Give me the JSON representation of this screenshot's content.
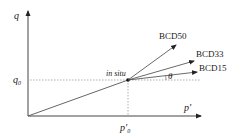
{
  "diagram": {
    "axes": {
      "y_label": "q",
      "x_label": "p'",
      "q0_label": "q",
      "q0_sub": "0",
      "p0_label": "p'",
      "p0_sub": "0"
    },
    "point_label": "in situ",
    "angle_label": "θ",
    "paths": [
      {
        "label": "BCD50"
      },
      {
        "label": "BCD33"
      },
      {
        "label": "BCD15"
      }
    ],
    "colors": {
      "line": "#333333",
      "dotted": "#888888",
      "text": "#222222"
    }
  }
}
